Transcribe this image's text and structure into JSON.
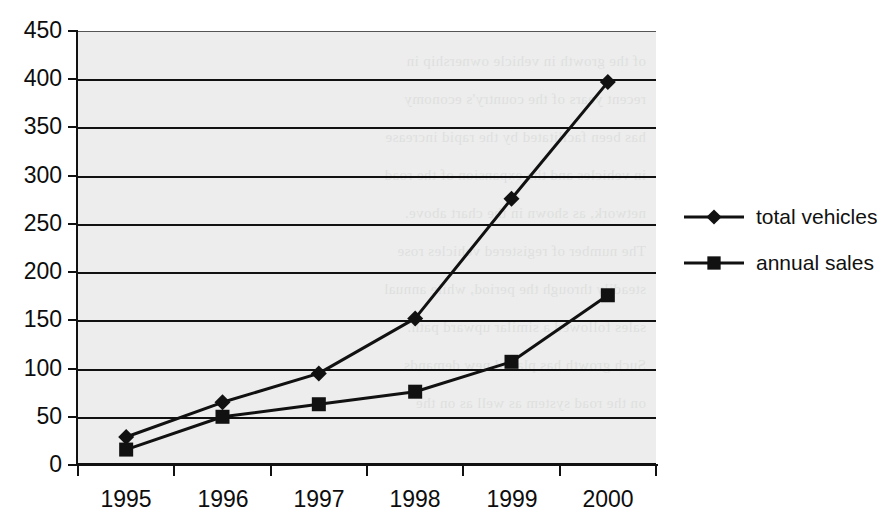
{
  "chart_data": {
    "type": "line",
    "title": "",
    "subtitle": "",
    "xlabel": "",
    "ylabel": "",
    "categories": [
      "1995",
      "1996",
      "1997",
      "1998",
      "1999",
      "2000"
    ],
    "series": [
      {
        "name": "total vehicles",
        "marker": "diamond",
        "color": "#111111",
        "values": [
          29,
          65,
          95,
          152,
          276,
          397
        ]
      },
      {
        "name": "annual sales",
        "marker": "square",
        "color": "#111111",
        "values": [
          16,
          50,
          63,
          76,
          107,
          176
        ]
      }
    ],
    "ylim": [
      0,
      450
    ],
    "ytick_step": 50,
    "yticks": [
      "0",
      "50",
      "100",
      "150",
      "200",
      "250",
      "300",
      "350",
      "400",
      "450"
    ],
    "grid": true,
    "grid_axis": "y",
    "legend_position": "right",
    "plot_background": "#ecedec",
    "page_background": "#ffffff"
  },
  "legend": {
    "entries": [
      {
        "label": "total vehicles",
        "marker": "diamond-marker"
      },
      {
        "label": "annual sales",
        "marker": "square-marker"
      }
    ]
  },
  "background_ghost_text": [
    "of the growth in vehicle ownership in",
    "recent years of the country's economy",
    "has been facilitated by the rapid increase",
    "in vehicles and the expansion of the road",
    "network, as shown in the chart above.",
    "The number of registered vehicles rose",
    "steadily through the period, while annual",
    "sales followed a similar upward path.",
    "Such growth has placed new demands",
    "on the road system as well as on the"
  ]
}
